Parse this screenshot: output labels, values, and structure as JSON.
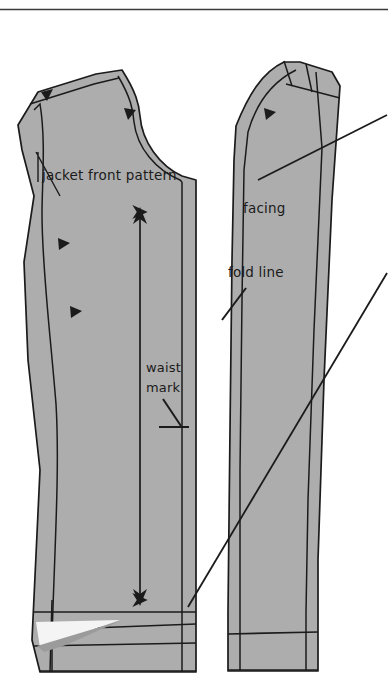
{
  "figure": {
    "kind": "sewing-pattern-diagram",
    "title_rule": "",
    "background_color": "#ffffff",
    "pattern_fill_color": "#adadad",
    "line_color": "#1b1b1b",
    "wedge_fill_color": "#9b9b9b",
    "wedge_highlight_color": "#f2f2f2"
  },
  "labels": {
    "jacket_front_pattern": "jacket front pattern",
    "facing": "facing",
    "fold_line": "fold line",
    "waist_line1": "waist",
    "waist_line2": "mark"
  },
  "annotations": [
    {
      "name": "grain-line",
      "description": "double headed vertical arrow",
      "x": 140,
      "y_top": 210,
      "y_bottom": 602
    },
    {
      "name": "waist-mark-pointer",
      "description": "leader from waist mark text to horizontal tick",
      "x1": 162,
      "y1": 398,
      "x2": 180,
      "y2": 426
    },
    {
      "name": "fold-line-pointer",
      "description": "short diagonal leader below fold line text",
      "x1": 245,
      "y1": 290,
      "x2": 222,
      "y2": 320
    },
    {
      "name": "upper-callout-line",
      "description": "long diagonal leader to right edge",
      "x1": 262,
      "y1": 175,
      "x2": 386,
      "y2": 116
    },
    {
      "name": "lower-callout-line",
      "description": "long diagonal leader from right edge to hem corner",
      "x1": 386,
      "y1": 274,
      "x2": 188,
      "y2": 607
    }
  ],
  "pieces": [
    {
      "name": "jacket-front",
      "label": "jacket front pattern",
      "side": "left"
    },
    {
      "name": "front-facing",
      "label": "facing",
      "side": "right"
    }
  ],
  "notches": [
    {
      "name": "shoulder-notch-left",
      "x": 46,
      "y": 98
    },
    {
      "name": "armhole-notch-upper",
      "x": 128,
      "y": 114
    },
    {
      "name": "side-notch-upper",
      "x": 64,
      "y": 242
    },
    {
      "name": "side-notch-lower",
      "x": 76,
      "y": 310
    },
    {
      "name": "facing-notch",
      "x": 270,
      "y": 115
    }
  ]
}
